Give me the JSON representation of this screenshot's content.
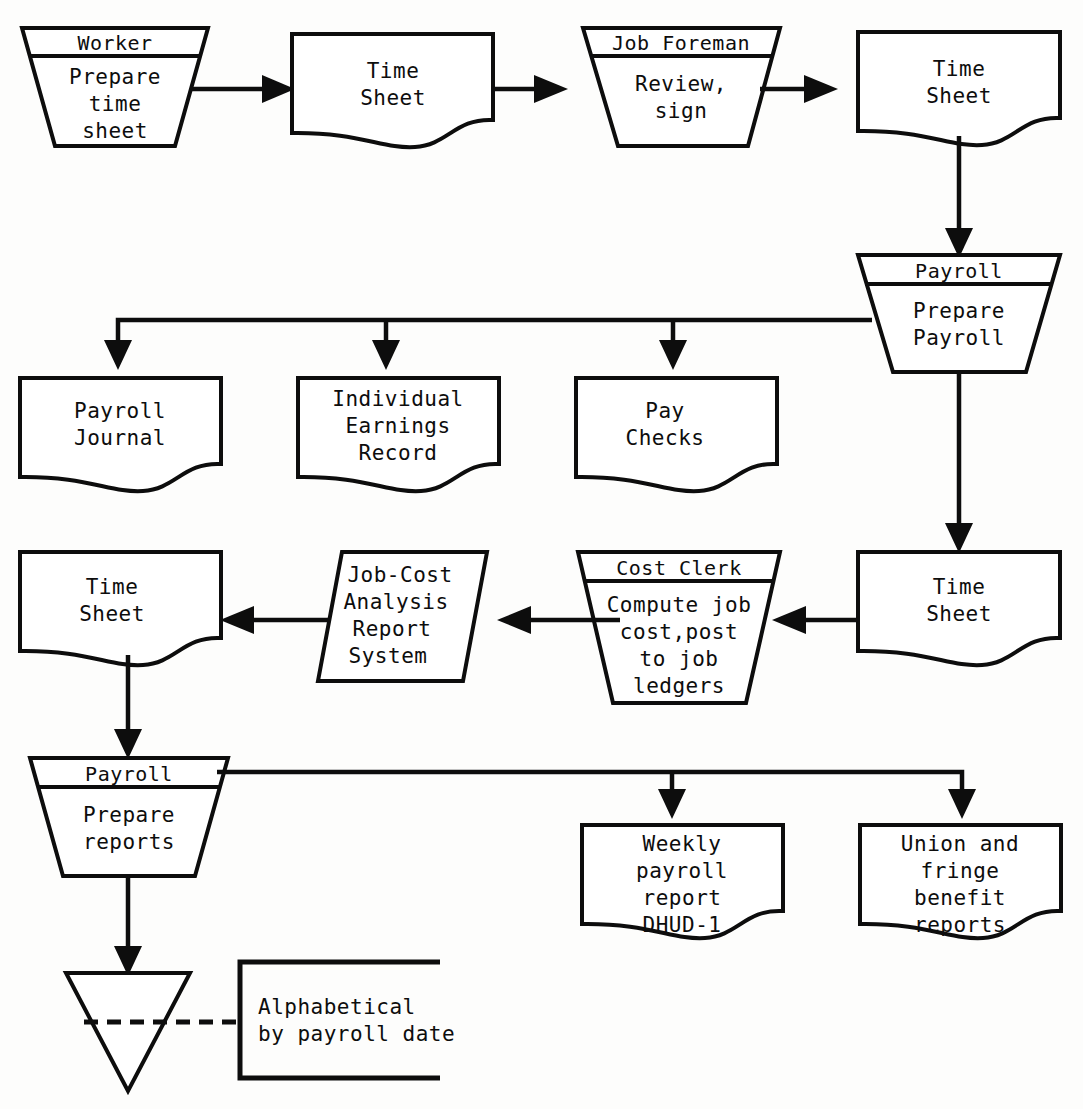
{
  "diagram": {
    "ink_color": "#0d0d0d",
    "background_color": "#fdfdfc"
  },
  "nodes": {
    "worker_process": {
      "shape": "trapezoid",
      "header": "Worker",
      "body_lines": [
        "Prepare",
        "time",
        "sheet"
      ]
    },
    "timesheet_1": {
      "shape": "document",
      "body_lines": [
        "Time",
        "Sheet"
      ]
    },
    "foreman_process": {
      "shape": "trapezoid",
      "header": "Job Foreman",
      "body_lines": [
        "Review,",
        "sign"
      ]
    },
    "timesheet_2": {
      "shape": "document",
      "body_lines": [
        "Time",
        "Sheet"
      ]
    },
    "payroll_prepare": {
      "shape": "trapezoid",
      "header": "Payroll",
      "body_lines": [
        "Prepare",
        "Payroll"
      ]
    },
    "payroll_journal": {
      "shape": "document",
      "body_lines": [
        "Payroll",
        "Journal"
      ]
    },
    "earnings_record": {
      "shape": "document",
      "body_lines": [
        "Individual",
        "Earnings",
        "Record"
      ]
    },
    "pay_checks": {
      "shape": "document",
      "body_lines": [
        "Pay",
        "Checks"
      ]
    },
    "timesheet_3": {
      "shape": "document",
      "body_lines": [
        "Time",
        "Sheet"
      ]
    },
    "cost_clerk": {
      "shape": "trapezoid",
      "header": "Cost Clerk",
      "body_lines": [
        "Compute job",
        "cost,post",
        "to job",
        "ledgers"
      ]
    },
    "jobcost_system": {
      "shape": "parallelogram",
      "body_lines": [
        "Job-Cost",
        "Analysis",
        "Report",
        "System"
      ]
    },
    "timesheet_4": {
      "shape": "document",
      "body_lines": [
        "Time",
        "Sheet"
      ]
    },
    "payroll_reports": {
      "shape": "trapezoid",
      "header": "Payroll",
      "body_lines": [
        "Prepare",
        "reports"
      ]
    },
    "weekly_report": {
      "shape": "document",
      "body_lines": [
        "Weekly",
        "payroll",
        "report",
        "DHUD-1"
      ]
    },
    "union_reports": {
      "shape": "document",
      "body_lines": [
        "Union and",
        "fringe",
        "benefit",
        "reports"
      ]
    },
    "file_store": {
      "shape": "inverted-triangle",
      "body_lines": []
    },
    "file_annotation": {
      "shape": "bracket-note",
      "body_lines": [
        "Alphabetical",
        "by payroll date"
      ]
    }
  }
}
